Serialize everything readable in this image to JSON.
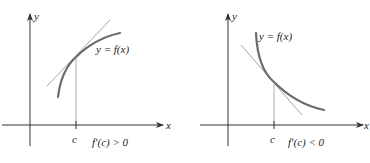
{
  "panels": [
    {
      "id": "increasing",
      "axis_x_label": "x",
      "axis_y_label": "y",
      "point_label": "c",
      "curve_label": "y = f(x)",
      "condition_label": "f′(c) > 0"
    },
    {
      "id": "decreasing",
      "axis_x_label": "x",
      "axis_y_label": "y",
      "point_label": "c",
      "curve_label": "y = f(x)",
      "condition_label": "f′(c) < 0"
    }
  ],
  "colors": {
    "axis": "#333333",
    "curve": "#6b6b6b",
    "tangent": "#9a9a9a",
    "guide": "#9a9a9a",
    "text": "#222222"
  }
}
